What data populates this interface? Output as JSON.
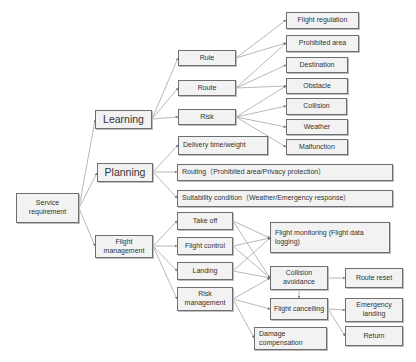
{
  "diagram": {
    "root": "Service requirement",
    "categories": {
      "learning": "Learning",
      "planning": "Planning",
      "flight_management": "Flight management"
    },
    "learning_items": {
      "rule": "Rule",
      "route": "Route",
      "risk": "Risk"
    },
    "learning_leaves": {
      "flight_regulation": "Flight regulation",
      "prohibited_area": "Prohibited area",
      "destination": "Destination",
      "obstacle": "Obstacle",
      "collision": "Collision",
      "weather": "Weather",
      "malfunction": "Malfunction"
    },
    "planning_items": {
      "delivery": "Delivery time/weight",
      "routing": "Routing（Prohibited area/Privacy protection）",
      "suitability": "Suitability condition（Weather/Emergency response）"
    },
    "flight_items": {
      "take_off": "Take off",
      "flight_control": "Flight control",
      "landing": "Landing",
      "risk_management": "Risk management"
    },
    "flight_outcomes": {
      "monitoring": "Flight monitoring (Flight data logging)",
      "collision_avoidance": "Collision avoidance",
      "flight_cancelling": "Flight cancelling",
      "damage_compensation": "Damage compensation",
      "route_reset": "Route reset",
      "emergency_landing": "Emergency landing",
      "return": "Return"
    },
    "colors": {
      "box_fill": "#f2f2f2",
      "box_border": "#6e6e6e",
      "edge": "#9a9a9a"
    }
  }
}
